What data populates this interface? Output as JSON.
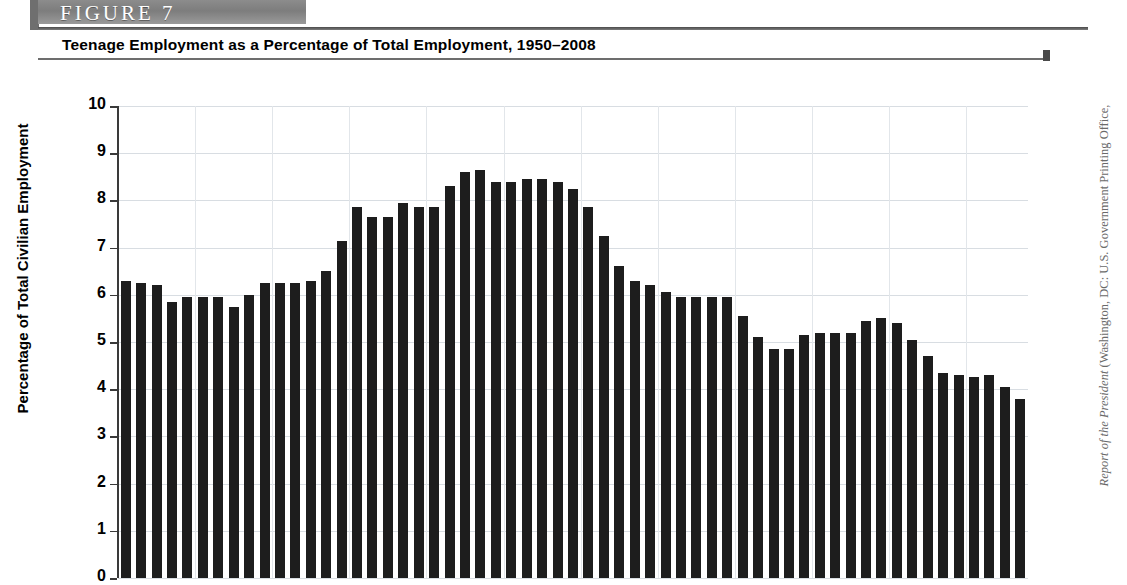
{
  "figure": {
    "banner_label": "FIGURE  7",
    "title": "Teenage Employment as a Percentage of Total Employment, 1950–2008"
  },
  "source": {
    "italic_part": "Report of the President",
    "roman_part": " (Washington, DC: U.S. Government Printing Office,"
  },
  "axis": {
    "y_title": "Percentage of Total Civilian Employment",
    "y_ticks": [
      "10",
      "9",
      "8",
      "7",
      "6",
      "5",
      "4",
      "3",
      "2",
      "1",
      "0"
    ]
  },
  "chart_data": {
    "type": "bar",
    "title": "Teenage Employment as a Percentage of Total Employment, 1950–2008",
    "xlabel": "",
    "ylabel": "Percentage of Total Civilian Employment",
    "ylim": [
      0,
      10
    ],
    "ytick_step": 1,
    "grid": true,
    "legend": false,
    "bar_color": "#1d1d1d",
    "categories": [
      1950,
      1951,
      1952,
      1953,
      1954,
      1955,
      1956,
      1957,
      1958,
      1959,
      1960,
      1961,
      1962,
      1963,
      1964,
      1965,
      1966,
      1967,
      1968,
      1969,
      1970,
      1971,
      1972,
      1973,
      1974,
      1975,
      1976,
      1977,
      1978,
      1979,
      1980,
      1981,
      1982,
      1983,
      1984,
      1985,
      1986,
      1987,
      1988,
      1989,
      1990,
      1991,
      1992,
      1993,
      1994,
      1995,
      1996,
      1997,
      1998,
      1999,
      2000,
      2001,
      2002,
      2003,
      2004,
      2005,
      2006,
      2007,
      2008
    ],
    "values": [
      6.3,
      6.25,
      6.2,
      5.85,
      5.95,
      5.95,
      5.95,
      5.75,
      6.0,
      6.25,
      6.25,
      6.25,
      6.3,
      6.5,
      7.15,
      7.85,
      7.65,
      7.65,
      7.95,
      7.85,
      7.85,
      8.3,
      8.6,
      8.65,
      8.4,
      8.4,
      8.45,
      8.45,
      8.4,
      8.25,
      7.85,
      7.25,
      6.6,
      6.3,
      6.2,
      6.05,
      5.95,
      5.95,
      5.95,
      5.95,
      5.55,
      5.1,
      4.85,
      4.85,
      5.15,
      5.2,
      5.2,
      5.2,
      5.45,
      5.5,
      5.4,
      5.05,
      4.7,
      4.35,
      4.3,
      4.25,
      4.3,
      4.05,
      3.8
    ]
  }
}
